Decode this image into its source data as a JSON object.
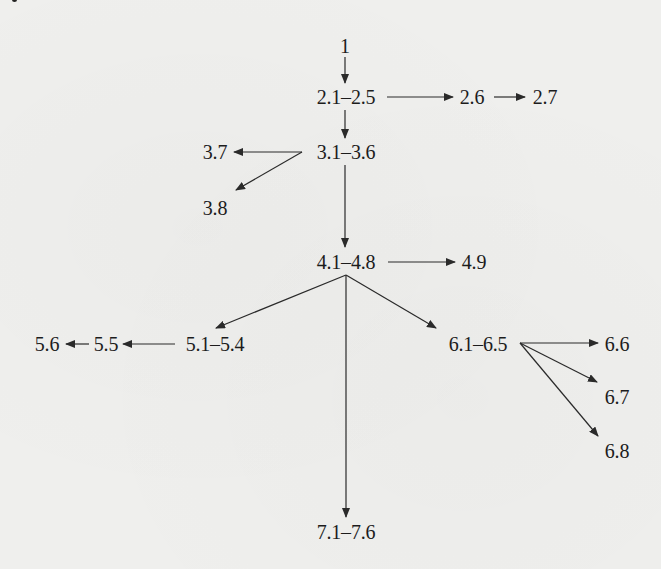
{
  "diagram": {
    "type": "dependency-graph",
    "colors": {
      "background": "#efefed",
      "ink": "#1c1c1c",
      "edge": "#2a2a2a"
    },
    "nodes": [
      {
        "id": "n1",
        "label": "1",
        "x": 345,
        "y": 46
      },
      {
        "id": "n2a",
        "label": "2.1–2.5",
        "x": 346,
        "y": 97
      },
      {
        "id": "n26",
        "label": "2.6",
        "x": 472,
        "y": 97
      },
      {
        "id": "n27",
        "label": "2.7",
        "x": 545,
        "y": 97
      },
      {
        "id": "n3a",
        "label": "3.1–3.6",
        "x": 346,
        "y": 152
      },
      {
        "id": "n37",
        "label": "3.7",
        "x": 215,
        "y": 152
      },
      {
        "id": "n38",
        "label": "3.8",
        "x": 215,
        "y": 208
      },
      {
        "id": "n4a",
        "label": "4.1–4.8",
        "x": 346,
        "y": 262
      },
      {
        "id": "n49",
        "label": "4.9",
        "x": 474,
        "y": 262
      },
      {
        "id": "n5a",
        "label": "5.1–5.4",
        "x": 215,
        "y": 344
      },
      {
        "id": "n55",
        "label": "5.5",
        "x": 106,
        "y": 344
      },
      {
        "id": "n56",
        "label": "5.6",
        "x": 47,
        "y": 344
      },
      {
        "id": "n6a",
        "label": "6.1–6.5",
        "x": 478,
        "y": 344
      },
      {
        "id": "n66",
        "label": "6.6",
        "x": 617,
        "y": 344
      },
      {
        "id": "n67",
        "label": "6.7",
        "x": 617,
        "y": 397
      },
      {
        "id": "n68",
        "label": "6.8",
        "x": 617,
        "y": 451
      },
      {
        "id": "n7a",
        "label": "7.1–7.6",
        "x": 346,
        "y": 532
      }
    ],
    "edges": [
      {
        "from": "1",
        "to": "2.1–2.5",
        "x1": 345,
        "y1": 57,
        "x2": 345,
        "y2": 83
      },
      {
        "from": "2.1–2.5",
        "to": "2.6",
        "x1": 387,
        "y1": 97,
        "x2": 453,
        "y2": 97
      },
      {
        "from": "2.6",
        "to": "2.7",
        "x1": 494,
        "y1": 97,
        "x2": 525,
        "y2": 97
      },
      {
        "from": "2.1–2.5",
        "to": "3.1–3.6",
        "x1": 345,
        "y1": 110,
        "x2": 345,
        "y2": 138
      },
      {
        "from": "3.1–3.6",
        "to": "3.7",
        "x1": 302,
        "y1": 152,
        "x2": 234,
        "y2": 152
      },
      {
        "from": "3.1–3.6",
        "to": "3.8",
        "x1": 302,
        "y1": 152,
        "x2": 236,
        "y2": 190
      },
      {
        "from": "3.1–3.6",
        "to": "4.1–4.8",
        "x1": 345,
        "y1": 165,
        "x2": 345,
        "y2": 247
      },
      {
        "from": "4.1–4.8",
        "to": "4.9",
        "x1": 388,
        "y1": 262,
        "x2": 455,
        "y2": 262
      },
      {
        "from": "4.1–4.8",
        "to": "5.1–5.4",
        "x1": 346,
        "y1": 275,
        "x2": 216,
        "y2": 328
      },
      {
        "from": "4.1–4.8",
        "to": "6.1–6.5",
        "x1": 346,
        "y1": 275,
        "x2": 436,
        "y2": 328
      },
      {
        "from": "4.1–4.8",
        "to": "7.1–7.6",
        "x1": 346,
        "y1": 275,
        "x2": 346,
        "y2": 517
      },
      {
        "from": "5.1–5.4",
        "to": "5.5",
        "x1": 175,
        "y1": 344,
        "x2": 123,
        "y2": 344
      },
      {
        "from": "5.5",
        "to": "5.6",
        "x1": 89,
        "y1": 344,
        "x2": 66,
        "y2": 344
      },
      {
        "from": "6.1–6.5",
        "to": "6.6",
        "x1": 520,
        "y1": 343,
        "x2": 598,
        "y2": 343
      },
      {
        "from": "6.1–6.5",
        "to": "6.7",
        "x1": 520,
        "y1": 343,
        "x2": 597,
        "y2": 382
      },
      {
        "from": "6.1–6.5",
        "to": "6.8",
        "x1": 520,
        "y1": 343,
        "x2": 598,
        "y2": 436
      }
    ]
  }
}
